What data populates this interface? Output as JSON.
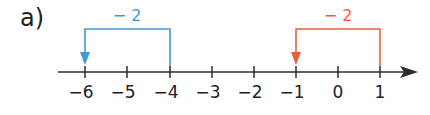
{
  "part_label": "a)",
  "number_line": {
    "ticks": [
      {
        "value": "−6",
        "x": 85
      },
      {
        "value": "−5",
        "x": 127
      },
      {
        "value": "−4",
        "x": 170
      },
      {
        "value": "−3",
        "x": 212
      },
      {
        "value": "−2",
        "x": 254
      },
      {
        "value": "−1",
        "x": 296
      },
      {
        "value": "0",
        "x": 338
      },
      {
        "value": "1",
        "x": 380
      }
    ],
    "axis_color": "#2b2b2b"
  },
  "jumps": [
    {
      "label": "− 2",
      "from": "−4",
      "to": "−6",
      "color": "#3a9bd5"
    },
    {
      "label": "− 2",
      "from": "1",
      "to": "−1",
      "color": "#ee5a3c"
    }
  ]
}
